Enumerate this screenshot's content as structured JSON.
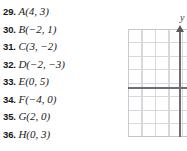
{
  "page": {
    "background_color": "#ffffff",
    "width": 187,
    "height": 151
  },
  "exercises": {
    "section_name": "ordered-pair-exercises",
    "items": [
      {
        "number": "29.",
        "expression": "A(4, 3)"
      },
      {
        "number": "30.",
        "expression": "B(−2, 1)"
      },
      {
        "number": "31.",
        "expression": "C(3, −2)"
      },
      {
        "number": "32.",
        "expression": "D(−2, −3)"
      },
      {
        "number": "33.",
        "expression": "E(0, 5)"
      },
      {
        "number": "34.",
        "expression": "F(−4, 0)"
      },
      {
        "number": "35.",
        "expression": "G(2, 0)"
      },
      {
        "number": "36.",
        "expression": "H(0, 3)"
      }
    ]
  },
  "graph": {
    "type": "coordinate-plane",
    "y_axis_label": "y",
    "grid_line_color": "#d8d8dc",
    "axis_color": "#6e6e72",
    "grid_spacing_px": 13.5,
    "x_axis_row_from_top": 4,
    "y_axis_column_from_left": 3.8,
    "columns_visible": 4,
    "rows_visible": 8,
    "note_cropped": "right portion of plane is cut off by image edge"
  }
}
